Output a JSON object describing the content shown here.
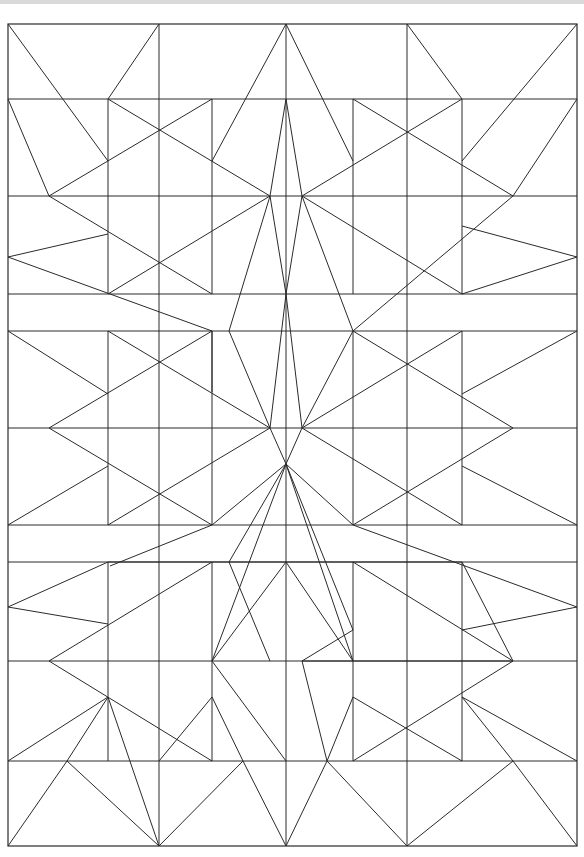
{
  "drawing": {
    "title": "",
    "description": "Symmetric geometric line pattern on a rectangular grid",
    "stroke_color": "#2a2a2a",
    "background_color": "#ffffff",
    "top_band_color": "#d9d9d9",
    "border": {
      "x1": 8,
      "y1": 24,
      "x2": 577,
      "y2": 846
    },
    "horizontal_lines_y": [
      99,
      196,
      294,
      331,
      428,
      525,
      562,
      661,
      761
    ],
    "vertical_lines": [
      {
        "x": 108,
        "y1": 99,
        "y2": 294
      },
      {
        "x": 159,
        "y1": 24,
        "y2": 846
      },
      {
        "x": 212,
        "y1": 99,
        "y2": 294
      },
      {
        "x": 286,
        "y1": 24,
        "y2": 846
      },
      {
        "x": 353,
        "y1": 99,
        "y2": 294
      },
      {
        "x": 407,
        "y1": 24,
        "y2": 846
      },
      {
        "x": 462,
        "y1": 99,
        "y2": 294
      },
      {
        "x": 108,
        "y1": 331,
        "y2": 525
      },
      {
        "x": 212,
        "y1": 331,
        "y2": 525
      },
      {
        "x": 353,
        "y1": 331,
        "y2": 525
      },
      {
        "x": 462,
        "y1": 331,
        "y2": 525
      },
      {
        "x": 108,
        "y1": 562,
        "y2": 761
      },
      {
        "x": 212,
        "y1": 562,
        "y2": 761
      },
      {
        "x": 353,
        "y1": 562,
        "y2": 761
      },
      {
        "x": 462,
        "y1": 562,
        "y2": 761
      }
    ],
    "diagonals": [
      [
        8,
        24,
        108,
        161
      ],
      [
        159,
        24,
        108,
        99
      ],
      [
        286,
        24,
        212,
        161
      ],
      [
        286,
        24,
        353,
        161
      ],
      [
        407,
        24,
        462,
        99
      ],
      [
        577,
        24,
        462,
        161
      ],
      [
        8,
        99,
        49,
        196
      ],
      [
        108,
        99,
        270,
        196
      ],
      [
        212,
        99,
        49,
        196
      ],
      [
        286,
        99,
        270,
        196
      ],
      [
        286,
        99,
        302,
        196
      ],
      [
        353,
        99,
        513,
        196
      ],
      [
        462,
        99,
        302,
        196
      ],
      [
        577,
        99,
        513,
        196
      ],
      [
        49,
        196,
        212,
        294
      ],
      [
        8,
        257,
        108,
        234
      ],
      [
        8,
        257,
        212,
        331
      ],
      [
        108,
        294,
        270,
        196
      ],
      [
        270,
        196,
        286,
        294
      ],
      [
        270,
        196,
        229,
        331
      ],
      [
        302,
        196,
        286,
        294
      ],
      [
        302,
        196,
        353,
        331
      ],
      [
        462,
        294,
        302,
        196
      ],
      [
        462,
        294,
        577,
        257
      ],
      [
        462,
        226,
        577,
        257
      ],
      [
        353,
        331,
        513,
        196
      ],
      [
        286,
        294,
        270,
        428
      ],
      [
        286,
        294,
        302,
        428
      ],
      [
        270,
        428,
        229,
        331
      ],
      [
        302,
        428,
        353,
        331
      ],
      [
        8,
        331,
        108,
        394
      ],
      [
        108,
        331,
        270,
        428
      ],
      [
        212,
        331,
        49,
        428
      ],
      [
        212,
        331,
        212,
        392
      ],
      [
        353,
        331,
        513,
        428
      ],
      [
        462,
        331,
        302,
        428
      ],
      [
        577,
        331,
        462,
        394
      ],
      [
        49,
        428,
        212,
        525
      ],
      [
        8,
        525,
        108,
        466
      ],
      [
        108,
        525,
        270,
        428
      ],
      [
        212,
        525,
        286,
        464
      ],
      [
        286,
        464,
        270,
        428
      ],
      [
        286,
        464,
        302,
        428
      ],
      [
        353,
        525,
        286,
        464
      ],
      [
        302,
        428,
        462,
        525
      ],
      [
        462,
        466,
        577,
        525
      ],
      [
        353,
        525,
        513,
        428
      ],
      [
        286,
        464,
        212,
        661
      ],
      [
        286,
        464,
        353,
        661
      ],
      [
        286,
        464,
        229,
        562
      ],
      [
        286,
        464,
        353,
        630
      ],
      [
        8,
        607,
        108,
        562
      ],
      [
        108,
        562,
        462,
        562
      ],
      [
        212,
        525,
        110,
        566
      ],
      [
        353,
        525,
        577,
        607
      ],
      [
        462,
        630,
        577,
        607
      ],
      [
        49,
        661,
        212,
        562
      ],
      [
        49,
        661,
        212,
        761
      ],
      [
        108,
        624,
        8,
        607
      ],
      [
        286,
        562,
        212,
        661
      ],
      [
        286,
        562,
        353,
        661
      ],
      [
        353,
        661,
        302,
        661
      ],
      [
        353,
        661,
        513,
        661
      ],
      [
        513,
        661,
        353,
        562
      ],
      [
        462,
        562,
        513,
        661
      ],
      [
        270,
        661,
        229,
        562
      ],
      [
        302,
        661,
        353,
        630
      ],
      [
        8,
        761,
        108,
        697
      ],
      [
        108,
        697,
        67,
        761
      ],
      [
        108,
        697,
        159,
        846
      ],
      [
        159,
        761,
        212,
        697
      ],
      [
        212,
        697,
        243,
        761
      ],
      [
        286,
        761,
        212,
        661
      ],
      [
        513,
        661,
        353,
        761
      ],
      [
        302,
        661,
        327,
        761
      ],
      [
        327,
        761,
        353,
        697
      ],
      [
        353,
        697,
        462,
        761
      ],
      [
        577,
        761,
        462,
        697
      ],
      [
        462,
        697,
        513,
        761
      ],
      [
        8,
        846,
        67,
        761
      ],
      [
        67,
        761,
        159,
        846
      ],
      [
        159,
        846,
        243,
        761
      ],
      [
        243,
        761,
        286,
        846
      ],
      [
        286,
        846,
        327,
        761
      ],
      [
        327,
        761,
        407,
        846
      ],
      [
        407,
        846,
        513,
        761
      ],
      [
        513,
        761,
        577,
        846
      ]
    ]
  }
}
